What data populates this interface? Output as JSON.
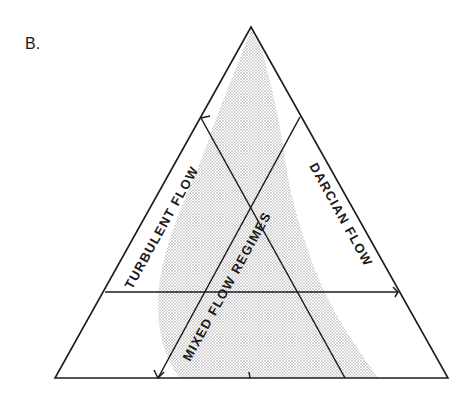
{
  "figure": {
    "panel_label": "B.",
    "regions": {
      "turbulent": "TURBULENT FLOW",
      "mixed": "MIXED FLOW REGIMES",
      "darcian": "DARCIAN FLOW"
    },
    "colors": {
      "line": "#1c1c1c",
      "shading": "#c8c8c8",
      "background": "#ffffff"
    }
  }
}
